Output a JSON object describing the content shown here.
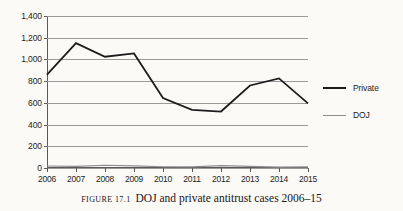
{
  "figure": {
    "caption_label": "FIGURE 17.1",
    "caption_text": "DOJ and private antitrust cases 2006–15"
  },
  "legend": {
    "position": "right",
    "items": [
      {
        "label": "Private",
        "color": "#1c1c1c"
      },
      {
        "label": "DOJ",
        "color": "#8d8d8d"
      }
    ]
  },
  "axes": {
    "y_ticks": [
      "0",
      "200",
      "400",
      "600",
      "800",
      "1,000",
      "1,200",
      "1,400"
    ],
    "x_ticks": [
      "2006",
      "2007",
      "2008",
      "2009",
      "2010",
      "2011",
      "2012",
      "2013",
      "2014",
      "2015"
    ]
  },
  "chart_data": {
    "type": "line",
    "title": "DOJ and private antitrust cases 2006–15",
    "xlabel": "",
    "ylabel": "",
    "ylim": [
      0,
      1400
    ],
    "ytick_step": 200,
    "grid": true,
    "legend_position": "right",
    "categories": [
      "2006",
      "2007",
      "2008",
      "2009",
      "2010",
      "2011",
      "2012",
      "2013",
      "2014",
      "2015"
    ],
    "series": [
      {
        "name": "Private",
        "color": "#1c1c1c",
        "values": [
          860,
          1150,
          1025,
          1055,
          645,
          535,
          520,
          760,
          825,
          595
        ]
      },
      {
        "name": "DOJ",
        "color": "#8d8d8d",
        "values": [
          18,
          15,
          25,
          20,
          12,
          10,
          22,
          15,
          8,
          10
        ]
      }
    ]
  }
}
